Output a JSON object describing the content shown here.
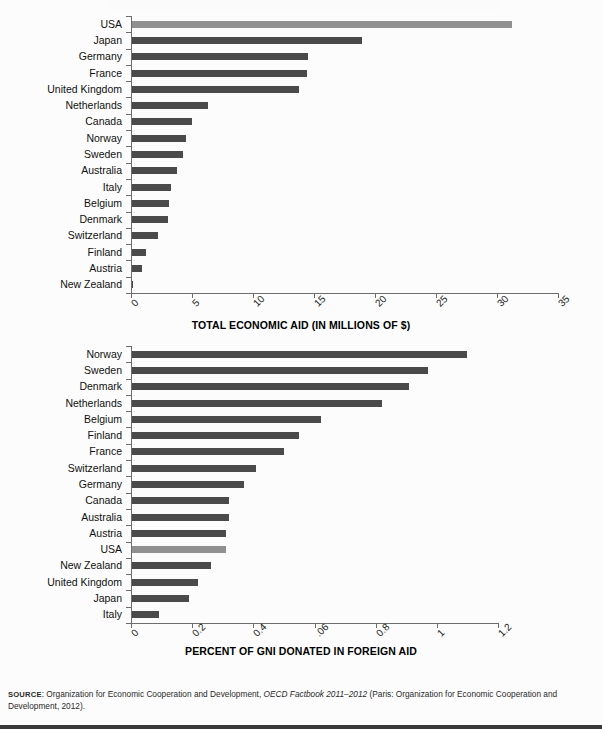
{
  "figure": {
    "source_note": {
      "kicker": "SOURCE",
      "text_before": ": Organization for Economic Cooperation and Development, ",
      "italic": "OECD Factbook 2011–2012",
      "text_after": " (Paris: Organization for Economic Cooperation and Development, 2012)."
    }
  },
  "chart_data": [
    {
      "type": "bar",
      "orientation": "horizontal",
      "id": "total-economic-aid",
      "title": "",
      "xlabel": "TOTAL ECONOMIC AID (IN MILLIONS OF $)",
      "ylabel": "",
      "xlim": [
        0,
        35
      ],
      "xticks": [
        0,
        5,
        10,
        15,
        20,
        25,
        30,
        35
      ],
      "xtick_labels": [
        "0",
        "5",
        "10",
        "15",
        "20",
        "25",
        "30",
        "35"
      ],
      "grid": false,
      "legend": "none",
      "highlight_category": "USA",
      "colors": {
        "bar": "#4a4a4a",
        "highlight": "#909090"
      },
      "categories": [
        "USA",
        "Japan",
        "Germany",
        "France",
        "United Kingdom",
        "Netherlands",
        "Canada",
        "Norway",
        "Sweden",
        "Australia",
        "Italy",
        "Belgium",
        "Denmark",
        "Switzerland",
        "Finland",
        "Austria",
        "New Zealand"
      ],
      "values": [
        31.2,
        18.9,
        14.5,
        14.4,
        13.8,
        6.3,
        5.0,
        4.5,
        4.3,
        3.8,
        3.3,
        3.1,
        3.0,
        2.2,
        1.2,
        0.9,
        0.15
      ]
    },
    {
      "type": "bar",
      "orientation": "horizontal",
      "id": "percent-gni-foreign-aid",
      "title": "",
      "xlabel": "PERCENT OF GNI DONATED IN FOREIGN AID",
      "ylabel": "",
      "xlim": [
        0,
        1.2
      ],
      "xticks": [
        0,
        0.2,
        0.4,
        0.6,
        0.8,
        1.0,
        1.2
      ],
      "xtick_labels": [
        "0",
        "0.2",
        "0.4",
        ".06",
        "0.8",
        "1",
        "1.2"
      ],
      "grid": false,
      "legend": "none",
      "highlight_category": "USA",
      "colors": {
        "bar": "#4a4a4a",
        "highlight": "#909090"
      },
      "categories": [
        "Norway",
        "Sweden",
        "Denmark",
        "Netherlands",
        "Belgium",
        "Finland",
        "France",
        "Switzerland",
        "Germany",
        "Canada",
        "Australia",
        "Austria",
        "USA",
        "New Zealand",
        "United Kingdom",
        "Japan",
        "Italy"
      ],
      "values": [
        1.1,
        0.97,
        0.91,
        0.82,
        0.62,
        0.55,
        0.5,
        0.41,
        0.37,
        0.32,
        0.32,
        0.31,
        0.31,
        0.26,
        0.22,
        0.19,
        0.09
      ]
    }
  ]
}
